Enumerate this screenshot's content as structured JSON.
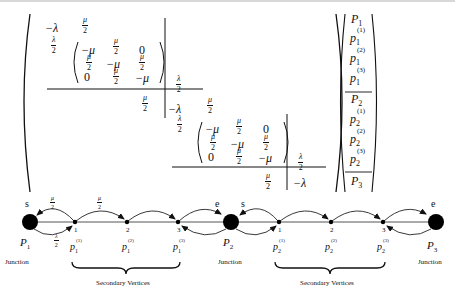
{
  "matrix": {
    "block1": {
      "corner_top_left": "−λ",
      "corner_top_right_num": "μ",
      "corner_left_num": "λ",
      "inner": [
        [
          "−μ",
          "μ/2",
          "0"
        ],
        [
          "μ/2",
          "−μ",
          "μ/2"
        ],
        [
          "0",
          "μ/2",
          "−μ"
        ]
      ],
      "right_num": "λ",
      "bottom_num": "μ"
    },
    "block2": {
      "corner_top_left": "−λ",
      "corner_top_right_num": "μ",
      "corner_left_num": "λ",
      "inner": [
        [
          "−μ",
          "μ/2",
          "0"
        ],
        [
          "μ/2",
          "−μ",
          "μ/2"
        ],
        [
          "0",
          "μ/2",
          "−μ"
        ]
      ],
      "right_num": "λ",
      "bottom_num": "μ",
      "bottom_right": "−λ"
    },
    "den": "2",
    "minus_mu": "−μ",
    "zero": "0"
  },
  "vector": {
    "entries": [
      {
        "base": "P",
        "sub": "1",
        "sup": ""
      },
      {
        "base": "p",
        "sub": "1",
        "sup": "(1)"
      },
      {
        "base": "p",
        "sub": "1",
        "sup": "(2)"
      },
      {
        "base": "p",
        "sub": "1",
        "sup": "(3)"
      },
      {
        "base": "P",
        "sub": "2",
        "sup": ""
      },
      {
        "base": "p",
        "sub": "2",
        "sup": "(1)"
      },
      {
        "base": "p",
        "sub": "2",
        "sup": "(2)"
      },
      {
        "base": "p",
        "sub": "2",
        "sup": "(3)"
      },
      {
        "base": "P",
        "sub": "3",
        "sup": ""
      }
    ]
  },
  "graph": {
    "junctions": [
      {
        "label_base": "P",
        "label_sub": "1",
        "caption": "Junction",
        "end_label": "s"
      },
      {
        "label_base": "P",
        "label_sub": "2",
        "caption": "Junction",
        "end_label_left": "e",
        "end_label_right": "s"
      },
      {
        "label_base": "P",
        "label_sub": "3",
        "caption": "Junction",
        "end_label": "e"
      }
    ],
    "segments": [
      {
        "vertices": [
          {
            "num": "1",
            "base": "p",
            "sub": "1",
            "sup": "(1)"
          },
          {
            "num": "2",
            "base": "p",
            "sub": "1",
            "sup": "(2)"
          },
          {
            "num": "3",
            "base": "p",
            "sub": "1",
            "sup": "(3)"
          }
        ],
        "brace_label": "Secondary Vertices"
      },
      {
        "vertices": [
          {
            "num": "1",
            "base": "p",
            "sub": "2",
            "sup": "(1)"
          },
          {
            "num": "2",
            "base": "p",
            "sub": "2",
            "sup": "(2)"
          },
          {
            "num": "3",
            "base": "p",
            "sub": "2",
            "sup": "(3)"
          }
        ],
        "brace_label": "Secondary Vertices"
      }
    ],
    "rates": {
      "mu_half_num": "μ",
      "lambda_half_num": "λ",
      "den": "2"
    }
  }
}
